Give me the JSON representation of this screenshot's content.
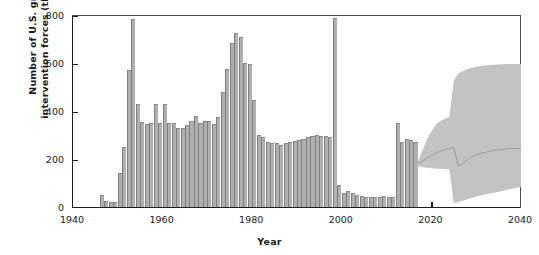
{
  "chart_data": {
    "type": "bar",
    "title": "",
    "xlabel": "Year",
    "ylabel": "Number of U.S. ground intervention forces (thousands)",
    "xlim": [
      1940,
      2040
    ],
    "ylim": [
      0,
      800
    ],
    "xticks": [
      1940,
      1960,
      1980,
      2000,
      2020,
      2040
    ],
    "yticks": [
      0,
      200,
      400,
      600,
      800
    ],
    "grid": false,
    "legend": null,
    "bar_color": "#b0b0b0",
    "band_color": "#c3c3c3",
    "median_color": "#9a9a9a",
    "axis_color": "#1d1d1d",
    "series": [
      {
        "name": "Historical U.S. ground intervention forces",
        "kind": "bar",
        "x": [
          1946,
          1947,
          1948,
          1949,
          1950,
          1951,
          1952,
          1953,
          1954,
          1955,
          1956,
          1957,
          1958,
          1959,
          1960,
          1961,
          1962,
          1963,
          1964,
          1965,
          1966,
          1967,
          1968,
          1969,
          1970,
          1971,
          1972,
          1973,
          1974,
          1975,
          1976,
          1977,
          1978,
          1979,
          1980,
          1981,
          1982,
          1983,
          1984,
          1985,
          1986,
          1987,
          1988,
          1989,
          1990,
          1991,
          1992,
          1993,
          1994,
          1995,
          1996,
          1997,
          1998,
          1999,
          2000,
          2001,
          2002,
          2003,
          2004,
          2005,
          2006,
          2007,
          2008,
          2009,
          2010,
          2011,
          2012,
          2013,
          2014,
          2015,
          2016
        ],
        "values": [
          52,
          26,
          22,
          22,
          140,
          250,
          570,
          785,
          430,
          355,
          345,
          350,
          430,
          350,
          430,
          350,
          350,
          330,
          330,
          340,
          360,
          380,
          350,
          360,
          360,
          345,
          375,
          480,
          575,
          685,
          725,
          710,
          600,
          595,
          445,
          300,
          290,
          270,
          265,
          265,
          260,
          265,
          270,
          275,
          280,
          285,
          290,
          295,
          300,
          297,
          295,
          290,
          788,
          90,
          60,
          65,
          60,
          48,
          45,
          40,
          42,
          42,
          40,
          45,
          42,
          40,
          350,
          270,
          285,
          280,
          270
        ]
      },
      {
        "name": "Projection median",
        "kind": "line",
        "x": [
          2017,
          2018,
          2019,
          2020,
          2021,
          2022,
          2023,
          2024,
          2025,
          2026,
          2027,
          2028,
          2029,
          2030,
          2031,
          2032,
          2033,
          2034,
          2035,
          2036,
          2037,
          2038,
          2039,
          2040
        ],
        "values": [
          185,
          195,
          208,
          218,
          228,
          236,
          243,
          248,
          252,
          175,
          185,
          200,
          215,
          222,
          228,
          232,
          236,
          240,
          242,
          244,
          246,
          248,
          248,
          250
        ]
      },
      {
        "name": "Projection uncertainty band (upper bound)",
        "kind": "band-upper",
        "x": [
          2017,
          2018,
          2019,
          2020,
          2021,
          2022,
          2023,
          2024,
          2025,
          2026,
          2027,
          2028,
          2029,
          2030,
          2031,
          2032,
          2033,
          2034,
          2035,
          2036,
          2037,
          2038,
          2039,
          2040
        ],
        "values": [
          195,
          240,
          285,
          320,
          348,
          362,
          372,
          380,
          530,
          560,
          570,
          578,
          584,
          588,
          592,
          594,
          596,
          597,
          598,
          599,
          600,
          600,
          600,
          600
        ]
      },
      {
        "name": "Projection uncertainty band (lower bound)",
        "kind": "band-lower",
        "x": [
          2017,
          2018,
          2019,
          2020,
          2021,
          2022,
          2023,
          2024,
          2025,
          2026,
          2027,
          2028,
          2029,
          2030,
          2031,
          2032,
          2033,
          2034,
          2035,
          2036,
          2037,
          2038,
          2039,
          2040
        ],
        "values": [
          175,
          170,
          168,
          166,
          165,
          164,
          163,
          162,
          20,
          25,
          30,
          36,
          42,
          48,
          52,
          56,
          60,
          64,
          68,
          72,
          76,
          80,
          84,
          88
        ]
      }
    ],
    "annotations": [
      {
        "label": "Korean War peak",
        "x": 1953,
        "y": 785
      },
      {
        "label": "Vietnam War peak",
        "x": 1968,
        "y": 725
      },
      {
        "label": "Gulf War peak",
        "x": 1991,
        "y": 788
      }
    ]
  }
}
